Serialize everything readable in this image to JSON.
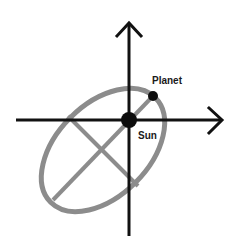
{
  "diagram": {
    "labels": {
      "planet": "Planet",
      "sun": "Sun"
    },
    "colors": {
      "axes": "#111111",
      "orbit": "#8c8c8c",
      "bodies": "#0d0d0d",
      "background": "#ffffff"
    },
    "elements": {
      "x_axis": {
        "from": [
          16,
          120
        ],
        "to": [
          222,
          120
        ]
      },
      "y_axis": {
        "from": [
          129,
          236
        ],
        "to": [
          129,
          22
        ]
      },
      "sun": {
        "cx": 129,
        "cy": 120,
        "r": 8
      },
      "planet": {
        "cx": 153,
        "cy": 96,
        "r": 5
      },
      "orbit_ellipse": {
        "cx": 103,
        "cy": 150,
        "rx": 74,
        "ry": 46,
        "rotation_deg": -45
      }
    }
  }
}
